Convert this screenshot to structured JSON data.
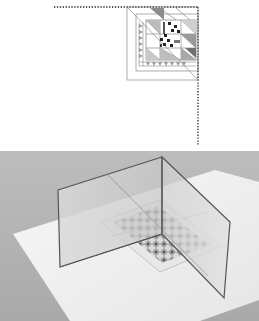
{
  "figure": {
    "top_panel": {
      "description": "Quilt block quarter drawing with dotted mirror lines",
      "mirror_line_style": "dotted",
      "mirror_line_color": "#222222"
    },
    "bottom_panel": {
      "description": "Photo of two hinged mirrors standing at right angles over a quilt block drawing on white paper",
      "background_color": "#b9b9b9",
      "paper_color": "#f4f4f4",
      "mirror_edge_color": "#555555"
    }
  }
}
